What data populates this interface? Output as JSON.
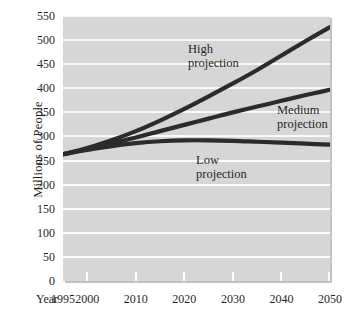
{
  "chart_data": {
    "type": "line",
    "title": "",
    "xlabel": "Year",
    "ylabel": "Millions of People",
    "xlim": [
      1995,
      2050
    ],
    "ylim": [
      0,
      550
    ],
    "grid": true,
    "legend_position": "inline-annotations",
    "x_axis_prefix": "Year",
    "x_tick_labels": [
      "1995",
      "2000",
      "2010",
      "2020",
      "2030",
      "2040",
      "2050"
    ],
    "x_tick_values": [
      1995,
      2000,
      2010,
      2020,
      2030,
      2040,
      2050
    ],
    "y_tick_labels": [
      "550",
      "500",
      "450",
      "400",
      "350",
      "300",
      "250",
      "200",
      "150",
      "100",
      "50",
      "0"
    ],
    "y_tick_values": [
      550,
      500,
      450,
      400,
      350,
      300,
      250,
      200,
      150,
      100,
      50,
      0
    ],
    "x": [
      1995,
      2000,
      2005,
      2010,
      2015,
      2020,
      2025,
      2030,
      2035,
      2040,
      2045,
      2050
    ],
    "series": [
      {
        "name": "High projection",
        "label_line1": "High",
        "label_line2": "projection",
        "color": "#2b2b2b",
        "values": [
          263,
          276,
          292,
          311,
          333,
          357,
          383,
          410,
          438,
          468,
          498,
          527
        ]
      },
      {
        "name": "Medium projection",
        "label_line1": "Medium",
        "label_line2": "projection",
        "color": "#2b2b2b",
        "values": [
          263,
          274,
          286,
          298,
          311,
          324,
          337,
          350,
          362,
          374,
          386,
          397
        ]
      },
      {
        "name": "Low projection",
        "label_line1": "Low",
        "label_line2": "projection",
        "color": "#2b2b2b",
        "values": [
          263,
          272,
          280,
          286,
          290,
          292,
          292,
          291,
          289,
          287,
          285,
          283
        ]
      }
    ],
    "colors": {
      "plot_background": "#d6d6d6",
      "gridline": "#fbfbfb",
      "curve": "#2b2b2b",
      "text": "#1f1f1f",
      "page_background": "#ffffff",
      "plot_shadow": "#c2c2c2"
    }
  }
}
